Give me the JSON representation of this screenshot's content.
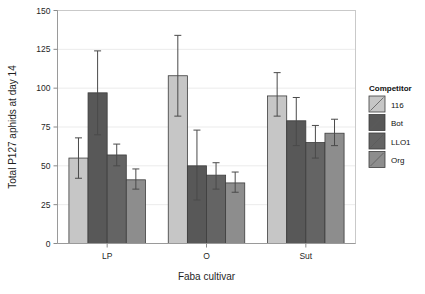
{
  "chart_data": {
    "type": "bar",
    "title": "",
    "xlabel": "Faba cultivar",
    "ylabel": "Total P127 aphids at day 14",
    "categories": [
      "LP",
      "O",
      "Sut"
    ],
    "ylim": [
      0,
      150
    ],
    "yticks": [
      0,
      25,
      50,
      75,
      100,
      125,
      150
    ],
    "ytick_labels": [
      "0",
      "25",
      "50",
      "75",
      "100",
      "125",
      "150"
    ],
    "grid": true,
    "legend_position": "right",
    "legend_title": "Competitor",
    "series": [
      {
        "name": "116",
        "color": "#c6c6c6",
        "values": [
          55,
          108,
          95
        ],
        "err_low": [
          42,
          82,
          82
        ],
        "err_high": [
          68,
          134,
          110
        ]
      },
      {
        "name": "Bot",
        "color": "#585858",
        "values": [
          97,
          50,
          79
        ],
        "err_low": [
          70,
          28,
          63
        ],
        "err_high": [
          124,
          73,
          94
        ]
      },
      {
        "name": "LLO1",
        "color": "#646464",
        "values": [
          57,
          44,
          65
        ],
        "err_low": [
          50,
          35,
          55
        ],
        "err_high": [
          64,
          52,
          76
        ]
      },
      {
        "name": "Org",
        "color": "#8d8d8d",
        "values": [
          41,
          39,
          71
        ],
        "err_low": [
          35,
          33,
          63
        ],
        "err_high": [
          48,
          46,
          80
        ]
      }
    ]
  },
  "legend": {
    "title": "Competitor",
    "items": [
      {
        "label": "116",
        "color": "#c6c6c6"
      },
      {
        "label": "Bot",
        "color": "#585858"
      },
      {
        "label": "LLO1",
        "color": "#646464"
      },
      {
        "label": "Org",
        "color": "#8d8d8d"
      }
    ]
  },
  "axes": {
    "y_label": "Total P127 aphids at day 14",
    "x_label": "Faba cultivar"
  }
}
